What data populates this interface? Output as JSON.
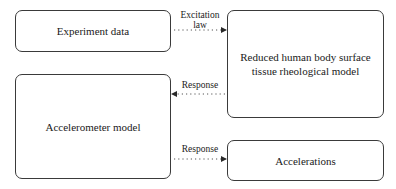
{
  "diagram": {
    "nodes": [
      {
        "id": "experiment",
        "label": "Experiment data"
      },
      {
        "id": "tissue",
        "label": "Reduced human body surface tissue rheological model"
      },
      {
        "id": "accelerometer",
        "label": "Accelerometer model"
      },
      {
        "id": "accelerations",
        "label": "Accelerations"
      }
    ],
    "edges": [
      {
        "from": "experiment",
        "to": "tissue",
        "label_line1": "Excitation",
        "label_line2": "law",
        "style": "dotted"
      },
      {
        "from": "tissue",
        "to": "accelerometer",
        "label": "Response",
        "style": "dotted"
      },
      {
        "from": "accelerometer",
        "to": "accelerations",
        "label": "Response",
        "style": "dotted"
      }
    ],
    "colors": {
      "box_border": "#3a3a3a",
      "arrow": "#3a3a3a",
      "background": "#ffffff"
    }
  }
}
